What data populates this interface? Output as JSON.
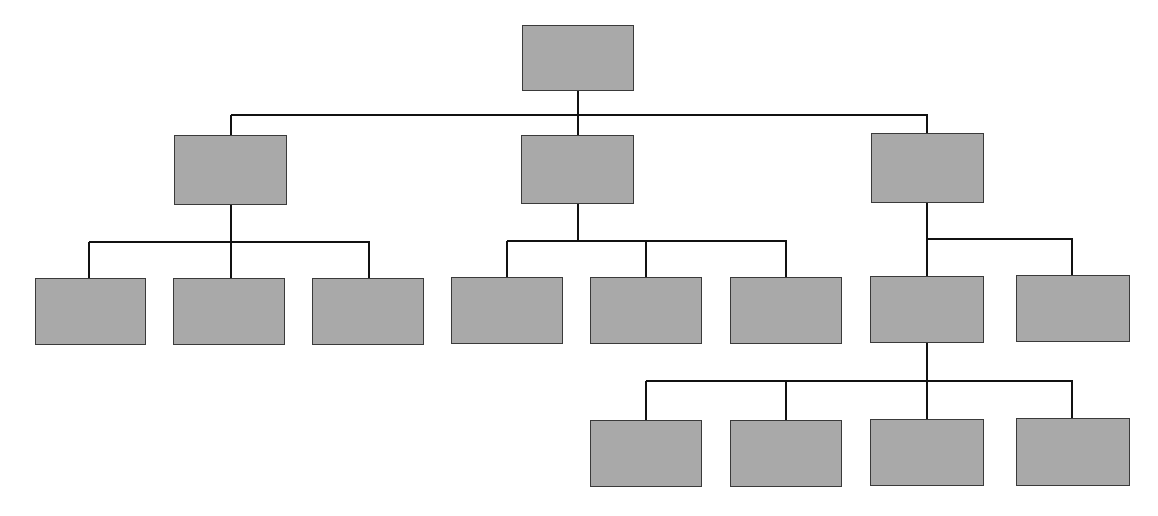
{
  "diagram": {
    "type": "org-chart",
    "colors": {
      "node_fill": "#a9a9a9",
      "node_border": "#3a3a3a",
      "connector": "#111111",
      "background": "#ffffff"
    },
    "nodes": [
      {
        "id": "root",
        "level": 0,
        "label": "",
        "x": 522,
        "y": 25,
        "w": 112,
        "h": 66
      },
      {
        "id": "l1-left",
        "level": 1,
        "parent": "root",
        "label": "",
        "x": 174,
        "y": 135,
        "w": 113,
        "h": 70
      },
      {
        "id": "l1-mid",
        "level": 1,
        "parent": "root",
        "label": "",
        "x": 521,
        "y": 135,
        "w": 113,
        "h": 69
      },
      {
        "id": "l1-right",
        "level": 1,
        "parent": "root",
        "label": "",
        "x": 871,
        "y": 133,
        "w": 113,
        "h": 70
      },
      {
        "id": "l2-a",
        "level": 2,
        "parent": "l1-left",
        "label": "",
        "x": 35,
        "y": 278,
        "w": 111,
        "h": 67
      },
      {
        "id": "l2-b",
        "level": 2,
        "parent": "l1-left",
        "label": "",
        "x": 173,
        "y": 278,
        "w": 112,
        "h": 67
      },
      {
        "id": "l2-c",
        "level": 2,
        "parent": "l1-left",
        "label": "",
        "x": 312,
        "y": 278,
        "w": 112,
        "h": 67
      },
      {
        "id": "l2-d",
        "level": 2,
        "parent": "l1-mid",
        "label": "",
        "x": 451,
        "y": 277,
        "w": 112,
        "h": 67
      },
      {
        "id": "l2-e",
        "level": 2,
        "parent": "l1-mid",
        "label": "",
        "x": 590,
        "y": 277,
        "w": 112,
        "h": 67
      },
      {
        "id": "l2-f",
        "level": 2,
        "parent": "l1-mid",
        "label": "",
        "x": 730,
        "y": 277,
        "w": 112,
        "h": 67
      },
      {
        "id": "l2-g",
        "level": 2,
        "parent": "l1-right",
        "label": "",
        "x": 870,
        "y": 276,
        "w": 114,
        "h": 67
      },
      {
        "id": "l2-h",
        "level": 2,
        "parent": "l1-right",
        "label": "",
        "x": 1016,
        "y": 275,
        "w": 114,
        "h": 67
      },
      {
        "id": "l3-a",
        "level": 3,
        "parent": "l2-g",
        "label": "",
        "x": 590,
        "y": 420,
        "w": 112,
        "h": 67
      },
      {
        "id": "l3-b",
        "level": 3,
        "parent": "l2-g",
        "label": "",
        "x": 730,
        "y": 420,
        "w": 112,
        "h": 67
      },
      {
        "id": "l3-c",
        "level": 3,
        "parent": "l2-g",
        "label": "",
        "x": 870,
        "y": 419,
        "w": 114,
        "h": 67
      },
      {
        "id": "l3-d",
        "level": 3,
        "parent": "l2-g",
        "label": "",
        "x": 1016,
        "y": 418,
        "w": 114,
        "h": 68
      }
    ],
    "connectors": [
      {
        "x1": 578,
        "y1": 91,
        "x2": 578,
        "y2": 115
      },
      {
        "x1": 231,
        "y1": 115,
        "x2": 928,
        "y2": 115
      },
      {
        "x1": 231,
        "y1": 115,
        "x2": 231,
        "y2": 135
      },
      {
        "x1": 578,
        "y1": 115,
        "x2": 578,
        "y2": 135
      },
      {
        "x1": 927,
        "y1": 115,
        "x2": 927,
        "y2": 133
      },
      {
        "x1": 231,
        "y1": 205,
        "x2": 231,
        "y2": 278
      },
      {
        "x1": 89,
        "y1": 242,
        "x2": 370,
        "y2": 242
      },
      {
        "x1": 89,
        "y1": 242,
        "x2": 89,
        "y2": 278
      },
      {
        "x1": 369,
        "y1": 242,
        "x2": 369,
        "y2": 278
      },
      {
        "x1": 578,
        "y1": 204,
        "x2": 578,
        "y2": 241
      },
      {
        "x1": 507,
        "y1": 241,
        "x2": 787,
        "y2": 241
      },
      {
        "x1": 507,
        "y1": 241,
        "x2": 507,
        "y2": 277
      },
      {
        "x1": 646,
        "y1": 241,
        "x2": 646,
        "y2": 277
      },
      {
        "x1": 786,
        "y1": 241,
        "x2": 786,
        "y2": 277
      },
      {
        "x1": 927,
        "y1": 203,
        "x2": 927,
        "y2": 276
      },
      {
        "x1": 927,
        "y1": 239,
        "x2": 1073,
        "y2": 239
      },
      {
        "x1": 1072,
        "y1": 239,
        "x2": 1072,
        "y2": 275
      },
      {
        "x1": 927,
        "y1": 343,
        "x2": 927,
        "y2": 419
      },
      {
        "x1": 646,
        "y1": 381,
        "x2": 1073,
        "y2": 381
      },
      {
        "x1": 646,
        "y1": 381,
        "x2": 646,
        "y2": 420
      },
      {
        "x1": 786,
        "y1": 381,
        "x2": 786,
        "y2": 420
      },
      {
        "x1": 1072,
        "y1": 380,
        "x2": 1072,
        "y2": 418
      }
    ]
  }
}
